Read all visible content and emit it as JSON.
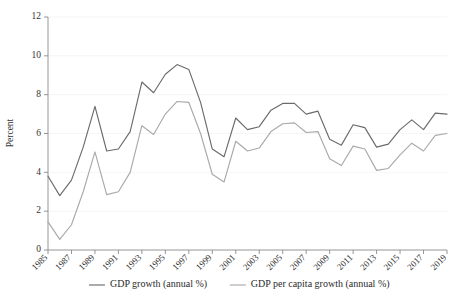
{
  "chart_data": {
    "type": "line",
    "title": "",
    "subtitle": "",
    "xlabel": "",
    "ylabel": "Percent",
    "ylim": [
      0,
      12
    ],
    "yticks": [
      0,
      2,
      4,
      6,
      8,
      10,
      12
    ],
    "xlim": [
      1985,
      2019
    ],
    "xticks": [
      1985,
      1987,
      1989,
      1991,
      1993,
      1995,
      1997,
      1999,
      2001,
      2003,
      2005,
      2007,
      2009,
      2011,
      2013,
      2015,
      2017,
      2019
    ],
    "xtick_labels": [
      "1985",
      "1987",
      "1989",
      "1991",
      "1993",
      "1995",
      "1997",
      "1999",
      "2001",
      "2003",
      "2005",
      "2007",
      "2009",
      "2011",
      "2013",
      "2015",
      "2017",
      "2019"
    ],
    "xtick_rotation": 45,
    "grid": "horizontal",
    "legend_position": "bottom",
    "x": [
      1985,
      1986,
      1987,
      1988,
      1989,
      1990,
      1991,
      1992,
      1993,
      1994,
      1995,
      1996,
      1997,
      1998,
      1999,
      2000,
      2001,
      2002,
      2003,
      2004,
      2005,
      2006,
      2007,
      2008,
      2009,
      2010,
      2011,
      2012,
      2013,
      2014,
      2015,
      2016,
      2017,
      2018,
      2019
    ],
    "series": [
      {
        "name": "GDP growth (annual %)",
        "color": "#6b6b6b",
        "values": [
          3.8,
          2.8,
          3.6,
          5.3,
          7.4,
          5.1,
          5.2,
          6.1,
          8.65,
          8.1,
          9.05,
          9.55,
          9.3,
          7.6,
          5.2,
          4.8,
          6.8,
          6.2,
          6.35,
          7.2,
          7.55,
          7.55,
          7.0,
          7.15,
          5.7,
          5.4,
          6.45,
          6.3,
          5.3,
          5.45,
          6.2,
          6.7,
          6.2,
          7.05,
          7.0
        ]
      },
      {
        "name": "GDP per capita growth (annual %)",
        "color": "#a9a9a9",
        "values": [
          1.45,
          0.55,
          1.3,
          3.0,
          5.05,
          2.85,
          3.0,
          4.0,
          6.4,
          5.95,
          7.0,
          7.65,
          7.6,
          6.0,
          3.9,
          3.5,
          5.6,
          5.1,
          5.25,
          6.1,
          6.5,
          6.55,
          6.05,
          6.1,
          4.7,
          4.35,
          5.35,
          5.2,
          4.1,
          4.2,
          4.9,
          5.5,
          5.1,
          5.9,
          6.0
        ]
      }
    ],
    "legend": [
      {
        "label": "GDP growth (annual %)",
        "color": "#6b6b6b"
      },
      {
        "label": "GDP per capita growth (annual %)",
        "color": "#a9a9a9"
      }
    ]
  }
}
